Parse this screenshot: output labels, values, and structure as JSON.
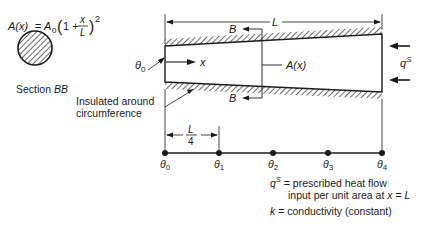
{
  "formula": {
    "lhs": "A(x)",
    "equals": "=",
    "coef": "A",
    "coef_sub": "0",
    "one_plus": "1 +",
    "frac_num": "x",
    "frac_den": "L",
    "exponent": "2"
  },
  "section": {
    "label_prefix": "Section ",
    "label_name": "BB"
  },
  "bar": {
    "length_label": "L",
    "section_marker_top": "B",
    "section_marker_bottom": "B",
    "axis_label": "x",
    "area_label": "A(x)",
    "left_temp_label": "θ",
    "left_temp_sub": "0",
    "flux_label": "q",
    "flux_sup": "S"
  },
  "insulation_note": {
    "line1": "Insulated around",
    "line2": "circumference"
  },
  "mesh": {
    "spacing_num": "L",
    "spacing_den": "4",
    "nodes": [
      {
        "label": "θ",
        "sub": "0"
      },
      {
        "label": "θ",
        "sub": "1"
      },
      {
        "label": "θ",
        "sub": "2"
      },
      {
        "label": "θ",
        "sub": "3"
      },
      {
        "label": "θ",
        "sub": "4"
      }
    ]
  },
  "legend": {
    "q_symbol": "q",
    "q_sup": "S",
    "q_desc_line1": " = prescribed heat flow",
    "q_desc_line2": "input per unit area at ",
    "q_desc_x": "x",
    "q_desc_eq": " = ",
    "q_desc_L": "L",
    "k_symbol": "k",
    "k_desc": " = conductivity (constant)"
  }
}
